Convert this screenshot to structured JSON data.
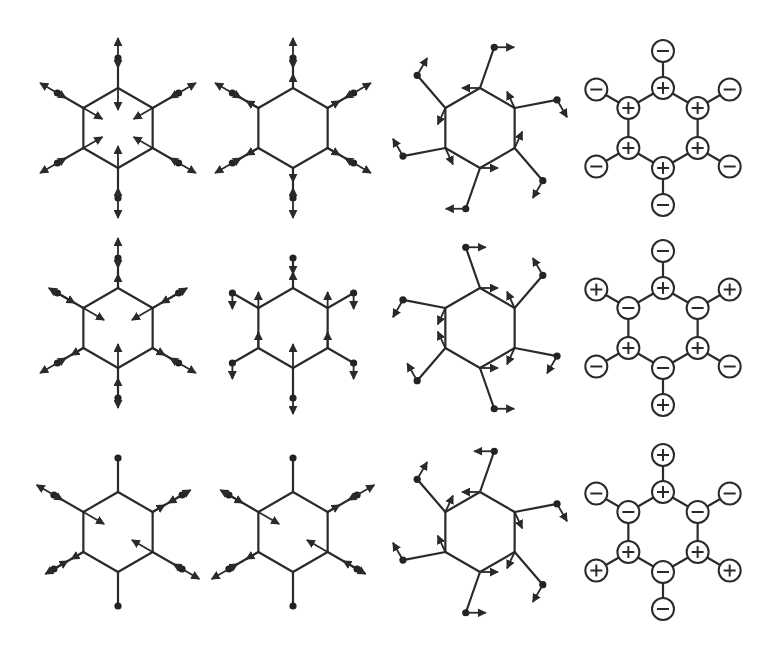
{
  "figure": {
    "colors": {
      "line": "#2a2a2a",
      "atom": "#222222",
      "background": "#ffffff"
    },
    "grid": {
      "columns_x": [
        118,
        293,
        480,
        663
      ],
      "rows_y": [
        128,
        328,
        532
      ],
      "ring_radius": 40,
      "h_radius_displacement": 70,
      "h_radius_torsion": 82,
      "phase_ring_radius": 40,
      "phase_outer_radius": 77,
      "phase_circle_r": 11
    },
    "vertex_order": [
      "top",
      "upper-right",
      "lower-right",
      "bottom",
      "lower-left",
      "upper-left"
    ],
    "rows": [
      {
        "panels": [
          {
            "type": "displacement",
            "h_radius": 70,
            "carbon_arrows": [
              {
                "dir": "in",
                "len": 22
              },
              {
                "dir": "in",
                "len": 22
              },
              {
                "dir": "in",
                "len": 22
              },
              {
                "dir": "in",
                "len": 22
              },
              {
                "dir": "in",
                "len": 22
              },
              {
                "dir": "in",
                "len": 22
              }
            ],
            "h_arrows": [
              {
                "dir": "out",
                "len": 20
              },
              {
                "dir": "out",
                "len": 20
              },
              {
                "dir": "out",
                "len": 20
              },
              {
                "dir": "out",
                "len": 20
              },
              {
                "dir": "out",
                "len": 20
              },
              {
                "dir": "out",
                "len": 20
              }
            ],
            "h_arrow_both": true
          },
          {
            "type": "displacement",
            "h_radius": 70,
            "carbon_arrows": [
              {
                "dir": "out",
                "len": 14
              },
              {
                "dir": "out",
                "len": 14
              },
              {
                "dir": "out",
                "len": 14
              },
              {
                "dir": "out",
                "len": 14
              },
              {
                "dir": "out",
                "len": 14
              },
              {
                "dir": "out",
                "len": 14
              }
            ],
            "h_arrows": [
              {
                "dir": "out",
                "len": 20
              },
              {
                "dir": "out",
                "len": 20
              },
              {
                "dir": "out",
                "len": 20
              },
              {
                "dir": "out",
                "len": 20
              },
              {
                "dir": "out",
                "len": 20
              },
              {
                "dir": "out",
                "len": 20
              }
            ],
            "h_arrow_both": true
          },
          {
            "type": "torsion",
            "h_radius": 82,
            "h_offset_deg": 10,
            "carbon_arrows": [
              {
                "angle": 180,
                "len": 18
              },
              {
                "angle": -115,
                "len": 18
              },
              {
                "angle": -65,
                "len": 18
              },
              {
                "angle": 0,
                "len": 18
              },
              {
                "angle": 65,
                "len": 18
              },
              {
                "angle": 115,
                "len": 18
              }
            ],
            "h_arrows": [
              {
                "angle": 0,
                "len": 20
              },
              {
                "angle": 60,
                "len": 20
              },
              {
                "angle": 120,
                "len": 20
              },
              {
                "angle": 180,
                "len": 20
              },
              {
                "angle": -120,
                "len": 20
              },
              {
                "angle": -60,
                "len": 20
              }
            ]
          },
          {
            "type": "phase",
            "ring_signs": [
              "+",
              "+",
              "+",
              "+",
              "+",
              "+"
            ],
            "outer_signs": [
              "−",
              "−",
              "−",
              "−",
              "−",
              "−"
            ]
          }
        ]
      },
      {
        "panels": [
          {
            "type": "displacement",
            "h_radius": 70,
            "carbon_arrows": [
              {
                "dir": "out",
                "len": 14
              },
              {
                "dir": "in",
                "len": 24
              },
              {
                "dir": "out",
                "len": 14
              },
              {
                "dir": "in",
                "len": 24
              },
              {
                "dir": "out",
                "len": 14
              },
              {
                "dir": "in",
                "len": 24
              }
            ],
            "h_arrows": [
              {
                "dir": "out",
                "len": 20
              },
              {
                "dir": "in",
                "len": 20
              },
              {
                "dir": "out",
                "len": 20
              },
              {
                "dir": "in",
                "len": 20
              },
              {
                "dir": "out",
                "len": 20
              },
              {
                "dir": "in",
                "len": 20
              }
            ],
            "h_arrow_both": true
          },
          {
            "type": "displacement-vertical",
            "h_radius": 70,
            "carbon_arrows": [
              {
                "angle": -90,
                "len": 16
              },
              {
                "angle": -90,
                "len": 16
              },
              {
                "angle": -90,
                "len": 16
              },
              {
                "angle": -90,
                "len": 24
              },
              {
                "angle": -90,
                "len": 16
              },
              {
                "angle": -90,
                "len": 16
              }
            ],
            "h_arrows": [
              {
                "angle": 90,
                "len": 16
              },
              {
                "angle": 90,
                "len": 16
              },
              {
                "angle": 90,
                "len": 16
              },
              {
                "angle": 90,
                "len": 16
              },
              {
                "angle": 90,
                "len": 16
              },
              {
                "angle": 90,
                "len": 16
              }
            ]
          },
          {
            "type": "torsion",
            "h_radius": 82,
            "h_offset_deg": -10,
            "carbon_arrows": [
              {
                "angle": 0,
                "len": 18
              },
              {
                "angle": -115,
                "len": 18
              },
              {
                "angle": 115,
                "len": 18
              },
              {
                "angle": 0,
                "len": 18
              },
              {
                "angle": -115,
                "len": 18
              },
              {
                "angle": 115,
                "len": 18
              }
            ],
            "h_arrows": [
              {
                "angle": 0,
                "len": 20
              },
              {
                "angle": -120,
                "len": 20
              },
              {
                "angle": 120,
                "len": 20
              },
              {
                "angle": 0,
                "len": 20
              },
              {
                "angle": -120,
                "len": 20
              },
              {
                "angle": 120,
                "len": 20
              }
            ]
          },
          {
            "type": "phase",
            "ring_signs": [
              "+",
              "−",
              "+",
              "−",
              "+",
              "−"
            ],
            "outer_signs": [
              "−",
              "+",
              "−",
              "+",
              "−",
              "+"
            ]
          }
        ]
      },
      {
        "panels": [
          {
            "type": "displacement",
            "h_radius": 74,
            "carbon_arrows": [
              {
                "dir": "none",
                "len": 0
              },
              {
                "dir": "out",
                "len": 14
              },
              {
                "dir": "in",
                "len": 24
              },
              {
                "dir": "none",
                "len": 0
              },
              {
                "dir": "out",
                "len": 14
              },
              {
                "dir": "in",
                "len": 24
              }
            ],
            "h_arrows": [
              {
                "dir": "none",
                "len": 0
              },
              {
                "dir": "in",
                "len": 16
              },
              {
                "dir": "out",
                "len": 20
              },
              {
                "dir": "none",
                "len": 0
              },
              {
                "dir": "in",
                "len": 16
              },
              {
                "dir": "out",
                "len": 20
              }
            ],
            "h_arrow_both": true
          },
          {
            "type": "displacement",
            "h_radius": 74,
            "carbon_arrows": [
              {
                "dir": "none",
                "len": 0
              },
              {
                "dir": "out",
                "len": 14
              },
              {
                "dir": "in",
                "len": 24
              },
              {
                "dir": "none",
                "len": 0
              },
              {
                "dir": "out",
                "len": 14
              },
              {
                "dir": "in",
                "len": 24
              }
            ],
            "h_arrows": [
              {
                "dir": "none",
                "len": 0
              },
              {
                "dir": "out",
                "len": 20
              },
              {
                "dir": "in",
                "len": 16
              },
              {
                "dir": "none",
                "len": 0
              },
              {
                "dir": "out",
                "len": 20
              },
              {
                "dir": "in",
                "len": 16
              }
            ],
            "h_arrow_both": true
          },
          {
            "type": "torsion",
            "h_radius": 82,
            "h_offset_deg": 10,
            "carbon_arrows": [
              {
                "angle": 180,
                "len": 18
              },
              {
                "angle": 65,
                "len": 18
              },
              {
                "angle": 115,
                "len": 18
              },
              {
                "angle": 0,
                "len": 18
              },
              {
                "angle": -115,
                "len": 18
              },
              {
                "angle": -65,
                "len": 18
              }
            ],
            "h_arrows": [
              {
                "angle": 180,
                "len": 20
              },
              {
                "angle": 60,
                "len": 20
              },
              {
                "angle": 120,
                "len": 20
              },
              {
                "angle": 0,
                "len": 20
              },
              {
                "angle": -120,
                "len": 20
              },
              {
                "angle": -60,
                "len": 20
              }
            ]
          },
          {
            "type": "phase",
            "ring_signs": [
              "+",
              "−",
              "+",
              "−",
              "+",
              "−"
            ],
            "outer_signs": [
              "+",
              "−",
              "+",
              "−",
              "+",
              "−"
            ]
          }
        ]
      }
    ]
  }
}
